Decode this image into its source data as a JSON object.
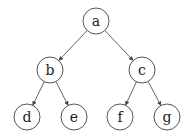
{
  "diagram": {
    "type": "binary-tree",
    "nodes": [
      {
        "id": "a",
        "label": "a",
        "x": 96,
        "y": 21
      },
      {
        "id": "b",
        "label": "b",
        "x": 50,
        "y": 70
      },
      {
        "id": "c",
        "label": "c",
        "x": 142,
        "y": 70
      },
      {
        "id": "d",
        "label": "d",
        "x": 27,
        "y": 117
      },
      {
        "id": "e",
        "label": "e",
        "x": 74,
        "y": 117
      },
      {
        "id": "f",
        "label": "f",
        "x": 120,
        "y": 117
      },
      {
        "id": "g",
        "label": "g",
        "x": 167,
        "y": 117
      }
    ],
    "edges": [
      {
        "from": "a",
        "to": "b"
      },
      {
        "from": "a",
        "to": "c"
      },
      {
        "from": "b",
        "to": "d"
      },
      {
        "from": "b",
        "to": "e"
      },
      {
        "from": "c",
        "to": "f"
      },
      {
        "from": "c",
        "to": "g"
      }
    ],
    "node_radius": 13,
    "colors": {
      "stroke": "#555555",
      "text": "#222222",
      "background": "#ffffff"
    }
  }
}
